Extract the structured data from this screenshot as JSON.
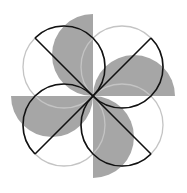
{
  "diagram": {
    "title": "",
    "colors": {
      "background": "#ffffff",
      "petal_fill": "#a6a6a6",
      "circle_light": "#c4c4c4",
      "circle_dark": "#111111",
      "diameter_line": "#111111"
    },
    "center": [
      93,
      96
    ],
    "petals": [
      {
        "name": "top-petal",
        "path": "M93,14 A41,41 0 0 0 93,96 Z"
      },
      {
        "name": "right-petal",
        "path": "M93,96 A41,41 0 0 1 175,96 Z"
      },
      {
        "name": "bottom-petal",
        "path": "M93,96 A41,41 0 0 1 93,178 Z"
      },
      {
        "name": "left-petal",
        "path": "M11,96 A41,41 0 0 0 93,96 Z"
      }
    ],
    "circles": [
      {
        "name": "top-left-circle",
        "cx": 64,
        "cy": 67,
        "r": 41,
        "dark_arc": "M35,38 A41,41 0 0 1 93,96",
        "diameter": [
          35,
          38,
          93,
          96
        ]
      },
      {
        "name": "top-right-circle",
        "cx": 122,
        "cy": 67,
        "r": 41,
        "dark_arc": "M151,38 A41,41 0 0 1 93,96",
        "diameter": [
          93,
          96,
          151,
          38
        ]
      },
      {
        "name": "bottom-right-circle",
        "cx": 122,
        "cy": 125,
        "r": 41,
        "dark_arc": "M151,154 A41,41 0 0 1 93,96",
        "diameter": [
          93,
          96,
          151,
          154
        ]
      },
      {
        "name": "bottom-left-circle",
        "cx": 64,
        "cy": 125,
        "r": 41,
        "dark_arc": "M35,154 A41,41 0 0 1 93,96",
        "diameter": [
          35,
          154,
          93,
          96
        ]
      }
    ]
  }
}
